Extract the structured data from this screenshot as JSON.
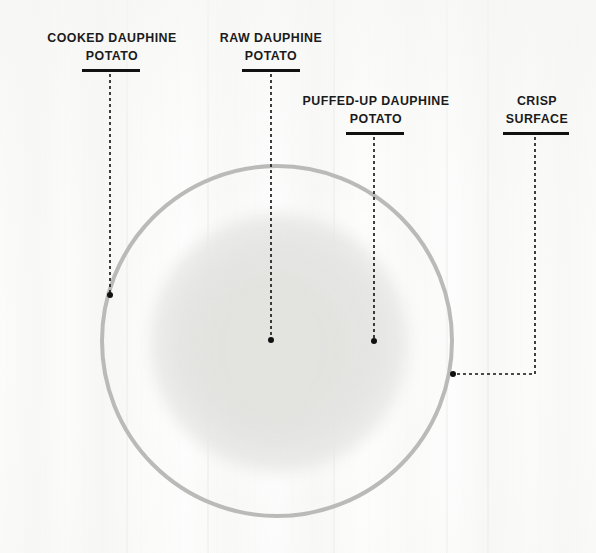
{
  "diagram": {
    "background_color": "#fbfbfa",
    "subject": {
      "name": "dauphine-potato",
      "ring_color": "#b7b7b5",
      "interior_color": "#e6e6e4",
      "center": [
        277,
        341
      ],
      "radius": 177
    },
    "text_color": "#1b1b1b",
    "rule_color": "#111111",
    "dot_color": "#111111"
  },
  "callouts": [
    {
      "id": "cooked-dauphine-potato",
      "label": "COOKED DAUPHINE\nPOTATO",
      "text_left": 38,
      "text_top": 30,
      "text_width": 148,
      "rule_left": 82,
      "rule_top": 69,
      "rule_width": 58,
      "leader": {
        "type": "vertical",
        "x": 110,
        "y_start": 74,
        "y_end": 293
      },
      "dot": {
        "x": 110,
        "y": 295
      }
    },
    {
      "id": "raw-dauphine-potato",
      "label": "RAW DAUPHINE\nPOTATO",
      "text_left": 212,
      "text_top": 30,
      "text_width": 118,
      "rule_left": 242,
      "rule_top": 69,
      "rule_width": 58,
      "leader": {
        "type": "vertical",
        "x": 271,
        "y_start": 74,
        "y_end": 338
      },
      "dot": {
        "x": 271,
        "y": 340
      }
    },
    {
      "id": "puffed-up-dauphine-potato",
      "label": "PUFFED-UP DAUPHINE\nPOTATO",
      "text_left": 297,
      "text_top": 93,
      "text_width": 158,
      "rule_left": 346,
      "rule_top": 132,
      "rule_width": 58,
      "leader": {
        "type": "vertical",
        "x": 374,
        "y_start": 137,
        "y_end": 339
      },
      "dot": {
        "x": 374,
        "y": 341
      }
    },
    {
      "id": "crisp-surface",
      "label": "CRISP\nSURFACE",
      "text_left": 494,
      "text_top": 93,
      "text_width": 86,
      "rule_left": 503,
      "rule_top": 132,
      "rule_width": 66,
      "leader": {
        "type": "elbow",
        "x": 535,
        "y_start": 137,
        "y_corner": 374,
        "x_end": 456
      },
      "dot": {
        "x": 453,
        "y": 374
      }
    }
  ]
}
